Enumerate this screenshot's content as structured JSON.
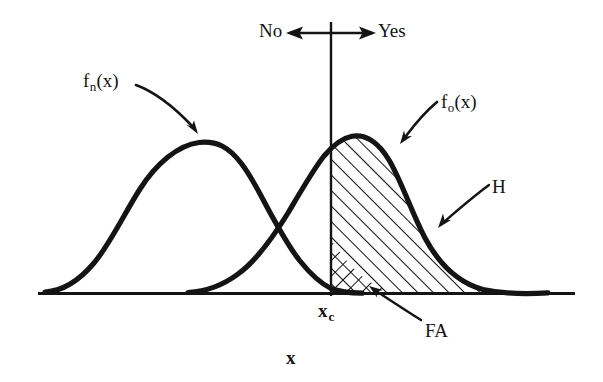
{
  "figure": {
    "width": 603,
    "height": 382,
    "background_color": "#ffffff",
    "ink_color": "#141414"
  },
  "axes": {
    "x_axis_label": "x",
    "baseline_y": 293,
    "baseline_x_start": 38,
    "baseline_x_end": 575
  },
  "criterion": {
    "label": "x",
    "subscript": "c",
    "x_position": 331,
    "line_top_y": 22,
    "line_bottom_y": 296
  },
  "decision_arrow": {
    "left_label": "No",
    "right_label": "Yes",
    "y_position": 33,
    "left_end_x": 288,
    "right_end_x": 374
  },
  "curves": [
    {
      "name": "noise-distribution",
      "label": "f",
      "label_subscript": "n",
      "label_suffix": "(x)",
      "peak_x": 215,
      "peak_y": 143,
      "start_x": 45,
      "end_x": 395
    },
    {
      "name": "signal-distribution",
      "label": "f",
      "label_subscript": "o",
      "label_suffix": "(x)",
      "peak_x": 355,
      "peak_y": 137,
      "start_x": 185,
      "end_x": 548
    }
  ],
  "regions": [
    {
      "name": "hits-region",
      "label": "H",
      "hatch": "single-diagonal",
      "description": "Area under signal curve right of criterion"
    },
    {
      "name": "false-alarms-region",
      "label": "FA",
      "hatch": "cross-hatch",
      "description": "Area under noise curve right of criterion"
    }
  ],
  "annotations": {
    "no_label": "No",
    "yes_label": "Yes",
    "hits_label": "H",
    "false_alarms_label": "FA",
    "criterion_label": "x",
    "criterion_subscript": "c",
    "x_axis_label": "x",
    "fn_base": "f",
    "fn_sub": "n",
    "fn_suffix": "(x)",
    "fo_base": "f",
    "fo_sub": "o",
    "fo_suffix": "(x)"
  }
}
